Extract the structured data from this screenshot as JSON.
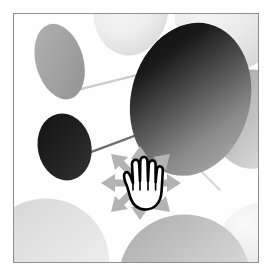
{
  "app": {
    "title": "Molecular structure viewport",
    "frame_border_color": "#8e8f92",
    "background_color": "#ffffff",
    "canvas_color": "#fefefe"
  },
  "viewport": {
    "label": "3D structure view",
    "width": 246,
    "height": 250
  },
  "cursor": {
    "name": "move-drag-cursor",
    "hand_label": "open-hand",
    "arrow_count": 8,
    "arrow_color": "#b3b3b3",
    "hand_fill": "#ffffff",
    "hand_outline": "#000000",
    "directions": [
      "up",
      "up-right",
      "right",
      "down-right",
      "down",
      "down-left",
      "left",
      "up-left"
    ]
  },
  "scene": {
    "type": "ball-and-stick",
    "bond_color": "#c9c9c9",
    "atoms": [
      {
        "id": "atom-gray-topleft",
        "label": "upper-left ellipsoid",
        "cx": 46,
        "cy": 48,
        "rx": 24,
        "ry": 38,
        "rotate": -18,
        "fill_start": "#a8a8a8",
        "fill_end": "#9a9a9a",
        "shade": "flat-gray"
      },
      {
        "id": "atom-pale-topcenter",
        "label": "top-center pale lobe",
        "cx": 118,
        "cy": -6,
        "rx": 38,
        "ry": 46,
        "rotate": 8,
        "fill_start": "#f2f2f2",
        "fill_end": "#dcdcdc",
        "shade": "pale"
      },
      {
        "id": "atom-pale-topright",
        "label": "top-right pale lobe",
        "cx": 216,
        "cy": 6,
        "rx": 52,
        "ry": 52,
        "rotate": 0,
        "fill_start": "#f4f4f4",
        "fill_end": "#dadada",
        "shade": "pale"
      },
      {
        "id": "atom-dark-right",
        "label": "large dark right ellipsoid",
        "cx": 180,
        "cy": 88,
        "rx": 62,
        "ry": 78,
        "rotate": 14,
        "fill_start": "#1a1a1a",
        "fill_end": "#9d9d9d",
        "shade": "strong-gradient"
      },
      {
        "id": "atom-mid-rightedge",
        "label": "right edge mid ellipsoid",
        "cx": 238,
        "cy": 106,
        "rx": 40,
        "ry": 48,
        "rotate": 0,
        "fill_start": "#b9b9b9",
        "fill_end": "#dcdcdc",
        "shade": "mid-gray"
      },
      {
        "id": "atom-dark-left",
        "label": "dark left ellipsoid",
        "cx": 51,
        "cy": 134,
        "rx": 27,
        "ry": 34,
        "rotate": -12,
        "fill_start": "#1c1c1c",
        "fill_end": "#2a2a2a",
        "shade": "near-black"
      },
      {
        "id": "atom-pale-bottomleft",
        "label": "bottom-left pale lobe",
        "cx": 34,
        "cy": 248,
        "rx": 62,
        "ry": 62,
        "rotate": 0,
        "fill_start": "#dadada",
        "fill_end": "#f0f0f0",
        "shade": "pale"
      },
      {
        "id": "atom-pale-bottomright",
        "label": "bottom-right pale lobe",
        "cx": 172,
        "cy": 262,
        "rx": 64,
        "ry": 62,
        "rotate": 0,
        "fill_start": "#b8b8b8",
        "fill_end": "#e8e8e8",
        "shade": "pale"
      },
      {
        "id": "atom-pale-bottomrightcorner",
        "label": "bottom-right corner lobe",
        "cx": 250,
        "cy": 232,
        "rx": 44,
        "ry": 40,
        "rotate": 0,
        "fill_start": "#dedede",
        "fill_end": "#f2f2f2",
        "shade": "pale"
      }
    ],
    "bonds": [
      {
        "id": "bond-topleft-to-center",
        "x1": 58,
        "y1": 78,
        "x2": 132,
        "y2": 60,
        "width": 2.2
      },
      {
        "id": "bond-darkleft-to-center",
        "x1": 72,
        "y1": 140,
        "x2": 150,
        "y2": 112,
        "width": 2.2
      },
      {
        "id": "bond-center-to-rightedge",
        "x1": 196,
        "y1": 116,
        "x2": 246,
        "y2": 108,
        "width": 2.2
      },
      {
        "id": "bond-center-to-bottomright",
        "x1": 170,
        "y1": 140,
        "x2": 206,
        "y2": 176,
        "width": 2.0
      }
    ]
  }
}
